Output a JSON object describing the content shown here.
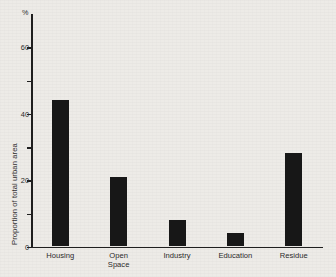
{
  "chart_data": {
    "type": "bar",
    "title": "",
    "xlabel": "",
    "ylabel": "Proportion of total urban area",
    "unit_label": "%",
    "categories": [
      "Housing",
      "Open\nSpace",
      "Industry",
      "Education",
      "Residue"
    ],
    "values": [
      44,
      21,
      8,
      4,
      28
    ],
    "ylim": [
      0,
      70
    ],
    "ytick_values": [
      0,
      10,
      20,
      30,
      40,
      50,
      60
    ],
    "ytick_labels": [
      "0",
      "",
      "20",
      "",
      "40",
      "",
      "60"
    ],
    "grid": false,
    "legend": false,
    "bar_color": "#171717",
    "axis_color": "#1f1f1f",
    "background_color": "#edebe7"
  }
}
